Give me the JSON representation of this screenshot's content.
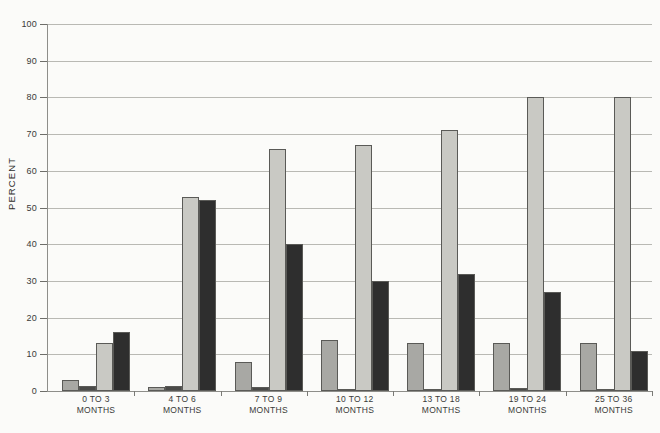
{
  "chart_data": {
    "type": "bar",
    "title": "",
    "subtitle": "",
    "xlabel": "",
    "ylabel": "PERCENT",
    "ylim": [
      0,
      100
    ],
    "ytick_labels": [
      "0",
      "10",
      "20",
      "30",
      "40",
      "50",
      "60",
      "70",
      "80",
      "90",
      "100"
    ],
    "ytick_values": [
      0,
      10,
      20,
      30,
      40,
      50,
      60,
      70,
      80,
      90,
      100
    ],
    "grid": true,
    "legend_position": "none",
    "categories": [
      "0 TO 3\nMONTHS",
      "4 TO 6\nMONTHS",
      "7 TO 9\nMONTHS",
      "10 TO 12\nMONTHS",
      "13 TO 18\nMONTHS",
      "19 TO 24\nMONTHS",
      "25 TO 36\nMONTHS"
    ],
    "category_lines": [
      [
        "0 TO 3",
        "MONTHS"
      ],
      [
        "4 TO 6",
        "MONTHS"
      ],
      [
        "7 TO 9",
        "MONTHS"
      ],
      [
        "10 TO 12",
        "MONTHS"
      ],
      [
        "13 TO 18",
        "MONTHS"
      ],
      [
        "19 TO 24",
        "MONTHS"
      ],
      [
        "25 TO 36",
        "MONTHS"
      ]
    ],
    "series": [
      {
        "name": "series-1",
        "color": "#a8a8a4",
        "values": [
          3,
          1,
          8,
          14,
          13,
          13,
          13
        ]
      },
      {
        "name": "series-2",
        "color": "#4a4a48",
        "values": [
          1.5,
          1.5,
          1,
          0.4,
          0.4,
          0.8,
          0.4
        ]
      },
      {
        "name": "series-3",
        "color": "#c9c9c4",
        "values": [
          13,
          53,
          66,
          67,
          71,
          80,
          80
        ]
      },
      {
        "name": "series-4",
        "color": "#2e2e2e",
        "values": [
          16,
          52,
          40,
          30,
          32,
          27,
          11
        ]
      }
    ]
  },
  "footer": {
    "note": ""
  }
}
